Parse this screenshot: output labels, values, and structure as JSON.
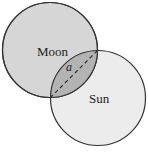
{
  "diagram": {
    "moon": {
      "label": "Moon",
      "cx": 50,
      "cy": 50,
      "r": 47.5,
      "fill": "#d6d6d6"
    },
    "sun": {
      "label": "Sun",
      "cx": 98,
      "cy": 98,
      "r": 47.5,
      "fill": "#ececec"
    },
    "overlap": {
      "fill": "#b3b3b3"
    },
    "chord": {
      "label": "a",
      "x1": 97.5,
      "y1": 50.5,
      "x2": 50.5,
      "y2": 97.5,
      "dash": "4,3"
    },
    "stroke": "#333333"
  }
}
